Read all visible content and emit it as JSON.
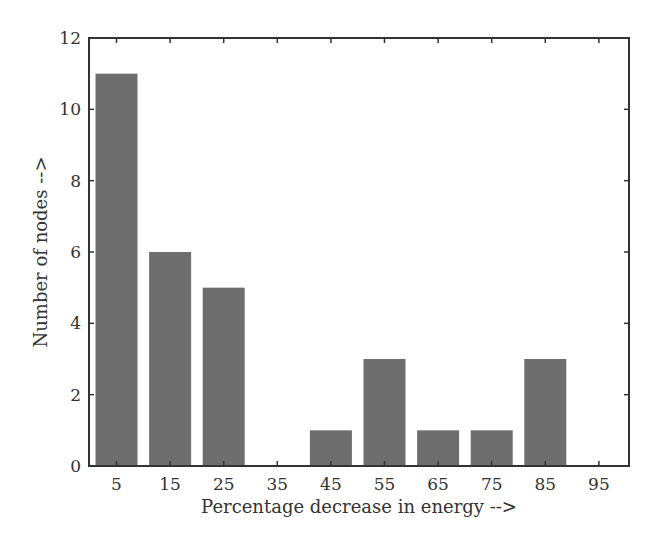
{
  "chart_data": {
    "type": "bar",
    "title": "",
    "xlabel": "Percentage decrease in energy -->",
    "ylabel": "Number of nodes -->",
    "categories": [
      "5",
      "15",
      "25",
      "35",
      "45",
      "55",
      "65",
      "75",
      "85",
      "95"
    ],
    "values": [
      11,
      6,
      5,
      0,
      1,
      3,
      1,
      1,
      3,
      0
    ],
    "ylim": [
      0,
      12
    ],
    "yticks": [
      0,
      2,
      4,
      6,
      8,
      10,
      12
    ],
    "grid": false,
    "legend": null,
    "bar_color": "#6e6e6e",
    "axis_color": "#333333"
  }
}
